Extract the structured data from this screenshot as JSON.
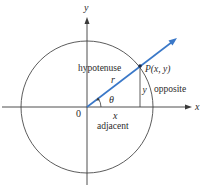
{
  "diagram": {
    "colors": {
      "axis": "#3a3a3a",
      "circle": "#4a4a4a",
      "ray": "#3a78c8",
      "point": "#1a2a4a",
      "text": "#2b2b2b"
    },
    "labels": {
      "y_axis": "y",
      "x_axis": "x",
      "origin": "0",
      "point": "P(x, y)",
      "radius": "r",
      "angle": "θ",
      "opposite_side": "y",
      "adjacent_side": "x",
      "hypotenuse": "hypotenuse",
      "opposite": "opposite",
      "adjacent": "adjacent"
    }
  }
}
